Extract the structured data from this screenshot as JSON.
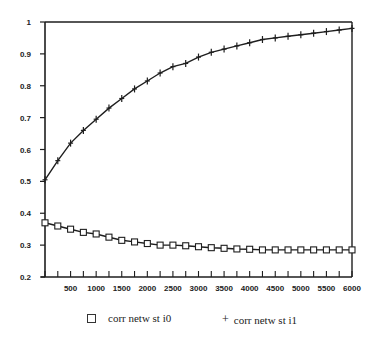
{
  "chart_data": {
    "type": "line",
    "title": "",
    "xlabel": "",
    "ylabel": "",
    "xlim": [
      0,
      6000
    ],
    "ylim": [
      0.2,
      1.0
    ],
    "grid": false,
    "legend_position": "bottom",
    "x_ticks": [
      500,
      1000,
      1500,
      2000,
      2500,
      3000,
      3500,
      4000,
      4500,
      5000,
      5500,
      6000
    ],
    "x_tick_labels": [
      "500",
      "1000",
      "1500",
      "2000",
      "2500",
      "3000",
      "3500",
      "4000",
      "4500",
      "5000",
      "5500",
      "6000"
    ],
    "y_ticks": [
      0.2,
      0.3,
      0.4,
      0.5,
      0.6,
      0.7,
      0.8,
      0.9,
      1
    ],
    "y_tick_labels": [
      "0.2",
      "0.3",
      "0.4",
      "0.5",
      "0.6",
      "0.7",
      "0.8",
      "0.9",
      "1"
    ],
    "x": [
      0,
      250,
      500,
      750,
      1000,
      1250,
      1500,
      1750,
      2000,
      2250,
      2500,
      2750,
      3000,
      3250,
      3500,
      3750,
      4000,
      4250,
      4500,
      4750,
      5000,
      5250,
      5500,
      5750,
      6000
    ],
    "series": [
      {
        "name": "corr netw st i0",
        "marker": "square",
        "values": [
          0.37,
          0.36,
          0.35,
          0.34,
          0.335,
          0.325,
          0.315,
          0.31,
          0.305,
          0.3,
          0.3,
          0.298,
          0.295,
          0.292,
          0.29,
          0.288,
          0.287,
          0.285,
          0.285,
          0.285,
          0.285,
          0.285,
          0.285,
          0.285,
          0.285
        ]
      },
      {
        "name": "corr netw st i1",
        "marker": "plus",
        "values": [
          0.505,
          0.565,
          0.62,
          0.66,
          0.695,
          0.73,
          0.76,
          0.79,
          0.815,
          0.84,
          0.86,
          0.87,
          0.89,
          0.905,
          0.915,
          0.925,
          0.935,
          0.945,
          0.95,
          0.955,
          0.96,
          0.965,
          0.97,
          0.975,
          0.98
        ]
      }
    ]
  },
  "legend": {
    "items": [
      {
        "symbol": "□",
        "label": "corr netw st i0"
      },
      {
        "symbol": "+",
        "label": "corr netw st i1"
      }
    ]
  }
}
